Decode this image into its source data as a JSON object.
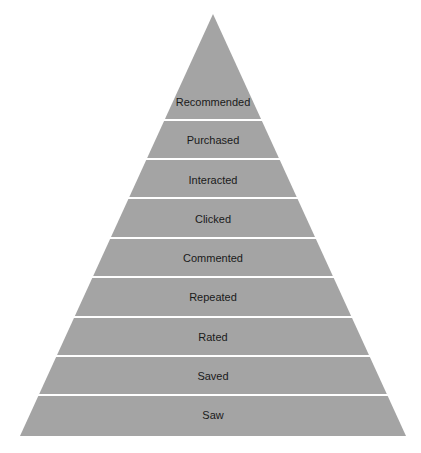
{
  "diagram": {
    "type": "pyramid",
    "fill_color": "#a4a4a4",
    "gap_color": "#ffffff",
    "apex": [
      213,
      14
    ],
    "base_y": 436,
    "base_left_x": 20,
    "base_right_x": 406,
    "levels_top_to_bottom": [
      {
        "label": "Recommended",
        "top": 14,
        "bottom": 119,
        "label_y": 103
      },
      {
        "label": "Purchased",
        "top": 121,
        "bottom": 158,
        "label_y": 141
      },
      {
        "label": "Interacted",
        "top": 160,
        "bottom": 197,
        "label_y": 181
      },
      {
        "label": "Clicked",
        "top": 199,
        "bottom": 237,
        "label_y": 220
      },
      {
        "label": "Commented",
        "top": 239,
        "bottom": 276,
        "label_y": 259
      },
      {
        "label": "Repeated",
        "top": 278,
        "bottom": 316,
        "label_y": 298
      },
      {
        "label": "Rated",
        "top": 318,
        "bottom": 355,
        "label_y": 338
      },
      {
        "label": "Saved",
        "top": 357,
        "bottom": 394,
        "label_y": 377
      },
      {
        "label": "Saw",
        "top": 396,
        "bottom": 436,
        "label_y": 416
      }
    ]
  }
}
